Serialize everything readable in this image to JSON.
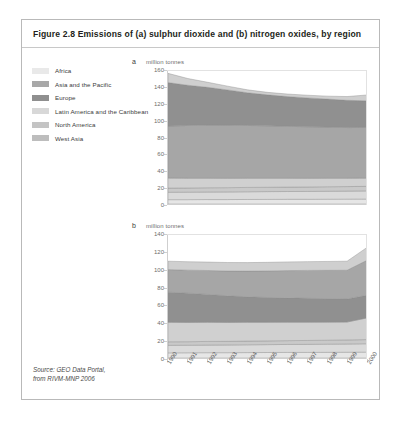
{
  "figure": {
    "title": "Figure 2.8 Emissions of (a) sulphur dioxide and (b) nitrogen oxides, by region",
    "source_line1": "Source: GEO Data Portal,",
    "source_line2": "from RIVM-MNP 2006"
  },
  "legend": {
    "items": [
      {
        "label": "Africa",
        "color": "#e9e9e9"
      },
      {
        "label": "Asia and the Pacific",
        "color": "#a8a8a8"
      },
      {
        "label": "Europe",
        "color": "#8f8f8f"
      },
      {
        "label": "Latin America and the Caribbean",
        "color": "#d8d8d8"
      },
      {
        "label": "North America",
        "color": "#c4c4c4"
      },
      {
        "label": "West Asia",
        "color": "#bdbdbd"
      }
    ]
  },
  "chart_data": [
    {
      "id": "a",
      "type": "area",
      "stacked": true,
      "panel_letter": "a",
      "title": "",
      "ylabel": "million tonnes",
      "xlabel": "",
      "grid": false,
      "legend_position": "left-outside",
      "ylim": [
        0,
        160
      ],
      "yticks": [
        0,
        20,
        40,
        60,
        80,
        100,
        120,
        140,
        160
      ],
      "categories": [
        "1990",
        "1991",
        "1992",
        "1993",
        "1994",
        "1995",
        "1996",
        "1997",
        "1998",
        "1999",
        "2000"
      ],
      "series": [
        {
          "name": "Africa",
          "color": "#e6e6e6",
          "values": [
            5.2,
            5.2,
            5.3,
            5.3,
            5.4,
            5.5,
            5.6,
            5.6,
            5.7,
            5.8,
            5.9
          ]
        },
        {
          "name": "Latin America and the Caribbean",
          "color": "#dadada",
          "values": [
            8.8,
            8.9,
            9.0,
            9.1,
            9.2,
            9.3,
            9.3,
            9.4,
            9.5,
            9.6,
            9.7
          ]
        },
        {
          "name": "West Asia",
          "color": "#c9c9c9",
          "values": [
            5.0,
            5.0,
            5.1,
            5.1,
            5.2,
            5.2,
            5.3,
            5.3,
            5.4,
            5.4,
            5.5
          ]
        },
        {
          "name": "North America",
          "color": "#d0d0d0",
          "values": [
            12.0,
            11.7,
            11.4,
            11.2,
            11.0,
            10.8,
            10.6,
            10.4,
            10.2,
            10.0,
            9.8
          ]
        },
        {
          "name": "Asia and the Pacific",
          "color": "#a6a6a6",
          "values": [
            62.0,
            63.0,
            63.5,
            63.5,
            63.0,
            62.5,
            62.0,
            61.5,
            61.0,
            60.5,
            60.5
          ]
        },
        {
          "name": "Europe",
          "color": "#909090",
          "values": [
            52.0,
            48.0,
            45.0,
            42.0,
            39.0,
            37.0,
            35.5,
            34.5,
            33.5,
            32.5,
            31.8
          ]
        },
        {
          "name": "Other",
          "color": "#cfcfcf",
          "values": [
            11.0,
            8.0,
            6.0,
            4.5,
            3.5,
            3.0,
            3.0,
            3.2,
            3.5,
            4.5,
            7.0
          ]
        }
      ],
      "totals": [
        156.0,
        149.8,
        145.3,
        140.7,
        136.3,
        133.3,
        131.3,
        129.9,
        128.8,
        128.3,
        130.2
      ]
    },
    {
      "id": "b",
      "type": "area",
      "stacked": true,
      "panel_letter": "b",
      "title": "",
      "ylabel": "million tonnes",
      "xlabel": "",
      "grid": false,
      "legend_position": "left-outside",
      "ylim": [
        0,
        140
      ],
      "yticks": [
        0,
        20,
        40,
        60,
        80,
        100,
        120,
        140
      ],
      "categories": [
        "1990",
        "1991",
        "1992",
        "1993",
        "1994",
        "1995",
        "1996",
        "1997",
        "1998",
        "1999",
        "2000"
      ],
      "series": [
        {
          "name": "Africa",
          "color": "#e6e6e6",
          "values": [
            5.8,
            5.9,
            6.0,
            6.0,
            6.1,
            6.2,
            6.3,
            6.3,
            6.4,
            6.5,
            6.6
          ]
        },
        {
          "name": "Latin America and the Caribbean",
          "color": "#dadada",
          "values": [
            8.5,
            8.5,
            8.6,
            8.7,
            8.8,
            8.9,
            9.0,
            9.1,
            9.2,
            9.3,
            9.5
          ]
        },
        {
          "name": "West Asia",
          "color": "#c9c9c9",
          "values": [
            4.0,
            4.0,
            4.1,
            4.1,
            4.2,
            4.2,
            4.3,
            4.4,
            4.5,
            4.6,
            4.7
          ]
        },
        {
          "name": "North America",
          "color": "#d0d0d0",
          "values": [
            22.0,
            21.8,
            21.6,
            21.4,
            21.2,
            21.0,
            20.8,
            20.6,
            20.4,
            20.2,
            24.5
          ]
        },
        {
          "name": "Europe",
          "color": "#909090",
          "values": [
            34.0,
            33.0,
            31.5,
            30.0,
            28.8,
            28.0,
            27.5,
            27.0,
            26.5,
            26.0,
            25.5
          ]
        },
        {
          "name": "Asia and the Pacific",
          "color": "#a6a6a6",
          "values": [
            25.5,
            26.0,
            27.0,
            28.0,
            29.0,
            30.0,
            30.8,
            31.5,
            32.0,
            32.5,
            39.5
          ]
        },
        {
          "name": "Other",
          "color": "#cfcfcf",
          "values": [
            9.5,
            9.5,
            9.5,
            9.6,
            9.6,
            9.7,
            9.8,
            9.9,
            10.0,
            10.2,
            14.5
          ]
        }
      ],
      "totals": [
        109.3,
        108.7,
        108.3,
        107.8,
        107.7,
        108.0,
        108.5,
        108.8,
        109.0,
        109.3,
        124.8
      ]
    }
  ]
}
